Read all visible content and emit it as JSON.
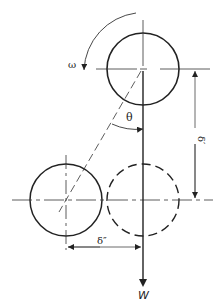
{
  "figure": {
    "type": "mechanics-diagram",
    "colors": {
      "line": "#222222",
      "background": "#ffffff"
    }
  },
  "labels": {
    "omega": "ω",
    "theta": "θ",
    "delta_prime": "δ′",
    "delta_double_prime": "δ″",
    "weight": "W"
  },
  "elements": {
    "top_circle": {
      "style": "solid",
      "role": "shaft position (rotated)"
    },
    "lower_left_circle": {
      "style": "solid",
      "role": "displaced shaft position"
    },
    "dashed_circle": {
      "style": "dashed",
      "role": "reference shaft position"
    },
    "rotation_arrow": {
      "direction": "counterclockwise",
      "symbol": "ω"
    },
    "load_arrow": {
      "direction": "down",
      "symbol": "W"
    }
  }
}
